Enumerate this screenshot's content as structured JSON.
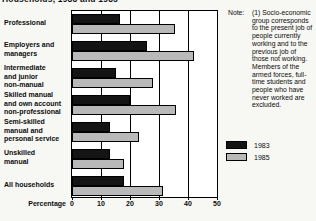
{
  "title_fragment": "Households, 1983 and 1985",
  "note": {
    "label": "Note:",
    "lines": [
      "(1) Socio-economic",
      "group corresponds",
      "to the present job of",
      "people currently",
      "working and to the",
      "previous job of",
      "those not working.",
      "Members of the",
      "armed forces, full-",
      "time students and",
      "people who have",
      "never worked are",
      "excluded."
    ]
  },
  "chart_data": {
    "type": "bar",
    "orientation": "horizontal",
    "xlabel": "Percentage",
    "xlim": [
      0,
      50
    ],
    "xticks": [
      0,
      10,
      20,
      30,
      40,
      50
    ],
    "grid": "vertical",
    "legend_position": "right-middle",
    "categories": [
      "Professional",
      "Employers and managers",
      "Intermediate and junior non-manual",
      "Skilled manual and own account non-professional",
      "Semi-skilled manual and personal service",
      "Unskilled manual",
      "All households"
    ],
    "category_label_lines": [
      [
        "Professional"
      ],
      [
        "Employers and",
        "managers"
      ],
      [
        "Intermediate",
        "and junior",
        "non-manual"
      ],
      [
        "Skilled manual",
        "and own account",
        "non-professional"
      ],
      [
        "Semi-skilled",
        "manual and",
        "personal service"
      ],
      [
        "Unskilled",
        "manual"
      ],
      [
        "All households"
      ]
    ],
    "series": [
      {
        "name": "1983",
        "color": "#141414",
        "values": [
          16.5,
          26,
          15,
          20,
          13,
          13,
          18
        ]
      },
      {
        "name": "1985",
        "color": "#b9b9b9",
        "values": [
          35.5,
          42,
          28,
          36,
          23,
          18,
          31.5
        ]
      }
    ]
  }
}
